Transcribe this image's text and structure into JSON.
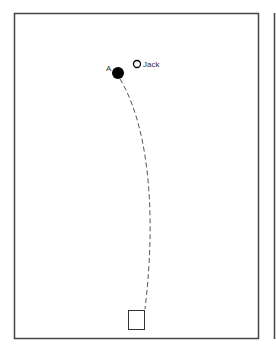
{
  "diagram": {
    "type": "bowls-green-shot-path",
    "labels": {
      "ball": "A",
      "jack": "Jack"
    },
    "colors": {
      "frame": "#444444",
      "ball": "#000000",
      "path": "#555555",
      "background": "#ffffff"
    },
    "elements": {
      "ball": {
        "cx": 118,
        "cy": 73,
        "r": 6
      },
      "jack": {
        "cx": 137,
        "cy": 64,
        "r": 4
      },
      "mat": {
        "x": 128,
        "y": 310,
        "w": 17,
        "h": 20
      }
    }
  }
}
